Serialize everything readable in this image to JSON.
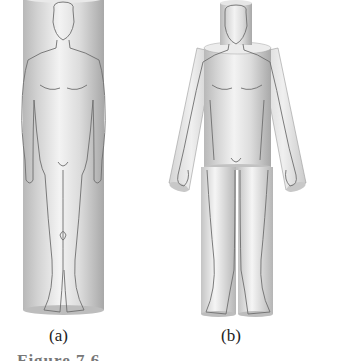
{
  "figure": {
    "panels": [
      {
        "id": "a",
        "label": "(a)",
        "description": "Human body modeled as a single cylinder"
      },
      {
        "id": "b",
        "label": "(b)",
        "description": "Human body modeled as multiple cylinders: head, trunk, arms, legs"
      }
    ],
    "caption_partial": "Figure 7.6"
  },
  "colors": {
    "cylinder_light": "#f2f2f2",
    "cylinder_mid": "#cfcfcf",
    "cylinder_dark": "#a9a9a9",
    "outline": "#6e6e6e",
    "label": "#222222"
  }
}
